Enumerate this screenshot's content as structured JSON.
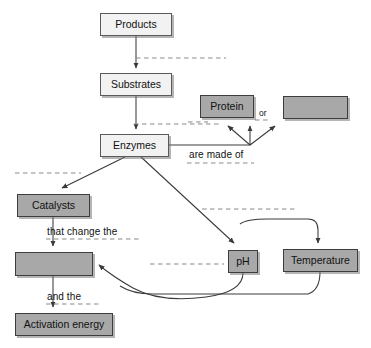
{
  "diagram": {
    "colors": {
      "light_box_fill": "#f2f2f2",
      "gray_box_fill": "#a8a8a8",
      "box_stroke": "#4a4a4a",
      "line": "#3a3a3a",
      "dashed_line": "#8a8a8a",
      "background": "#ffffff"
    },
    "nodes": [
      {
        "id": "products",
        "label": "Products",
        "style": "light",
        "x": 100,
        "y": 13,
        "w": 72,
        "h": 23
      },
      {
        "id": "substrates",
        "label": "Substrates",
        "style": "light",
        "x": 100,
        "y": 73,
        "w": 72,
        "h": 23
      },
      {
        "id": "enzymes",
        "label": "Enzymes",
        "style": "light",
        "x": 100,
        "y": 134,
        "w": 69,
        "h": 23
      },
      {
        "id": "protein",
        "label": "Protein",
        "style": "gray",
        "x": 200,
        "y": 95,
        "w": 54,
        "h": 23
      },
      {
        "id": "blank_right",
        "label": "",
        "style": "gray",
        "x": 283,
        "y": 96,
        "w": 65,
        "h": 23
      },
      {
        "id": "catalysts",
        "label": "Catalysts",
        "style": "gray",
        "x": 17,
        "y": 194,
        "w": 73,
        "h": 23
      },
      {
        "id": "blank_mid",
        "label": "",
        "style": "gray",
        "x": 15,
        "y": 252,
        "w": 78,
        "h": 24
      },
      {
        "id": "activation",
        "label": "Activation energy",
        "style": "gray",
        "x": 15,
        "y": 313,
        "w": 98,
        "h": 23
      },
      {
        "id": "ph",
        "label": "pH",
        "style": "gray",
        "x": 228,
        "y": 250,
        "w": 30,
        "h": 23
      },
      {
        "id": "temperature",
        "label": "Temperature",
        "style": "gray",
        "x": 283,
        "y": 249,
        "w": 75,
        "h": 23
      }
    ],
    "edge_labels": [
      {
        "id": "are_made_of",
        "text": "are made of",
        "x": 189,
        "y": 149
      },
      {
        "id": "that_change_the",
        "text": "that change the",
        "x": 47,
        "y": 226
      },
      {
        "id": "and_the",
        "text": "and the",
        "x": 47,
        "y": 291
      },
      {
        "id": "or",
        "text": "or",
        "x": 259,
        "y": 115
      }
    ],
    "blank_lines": [
      {
        "id": "blank-products-substrates",
        "x1": 136,
        "y1": 58,
        "x2": 226,
        "y2": 58
      },
      {
        "id": "blank-substrates-enzymes",
        "x1": 134,
        "y1": 124,
        "x2": 222,
        "y2": 124
      },
      {
        "id": "blank-are-made-of",
        "x1": 187,
        "y1": 163,
        "x2": 254,
        "y2": 163
      },
      {
        "id": "blank-protein-side",
        "x1": 188,
        "y1": 122,
        "x2": 208,
        "y2": 122
      },
      {
        "id": "blank-or",
        "x1": 255,
        "y1": 120,
        "x2": 268,
        "y2": 120
      },
      {
        "id": "blank-catalysts",
        "x1": 15,
        "y1": 173,
        "x2": 81,
        "y2": 173
      },
      {
        "id": "blank-that-change-the",
        "x1": 46,
        "y1": 239,
        "x2": 131,
        "y2": 239
      },
      {
        "id": "blank-and-the",
        "x1": 46,
        "y1": 304,
        "x2": 101,
        "y2": 304
      },
      {
        "id": "blank-ph-mid",
        "x1": 150,
        "y1": 264,
        "x2": 224,
        "y2": 264
      },
      {
        "id": "blank-ph-left",
        "x1": 134,
        "y1": 239,
        "x2": 141,
        "y2": 239
      },
      {
        "id": "blank-temperature-top",
        "x1": 202,
        "y1": 209,
        "x2": 295,
        "y2": 209
      }
    ]
  }
}
